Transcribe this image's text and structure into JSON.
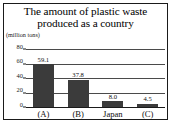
{
  "figure": {
    "title_line1": "The amount of plastic waste",
    "title_line2": "produced as a country",
    "unit_label": "(million tons)"
  },
  "chart_data": {
    "type": "bar",
    "title": "The amount of plastic waste produced as a country",
    "xlabel": "",
    "ylabel": "(million tons)",
    "ylim": [
      0,
      80
    ],
    "yticks": [
      "0",
      "20",
      "40",
      "60",
      "80"
    ],
    "grid": true,
    "legend": "none",
    "bar_color": "#3b3b3b",
    "categories": [
      "(A)",
      "(B)",
      "Japan",
      "(C)"
    ],
    "values": [
      59.1,
      37.8,
      8.0,
      4.5
    ],
    "value_labels": [
      "59.1",
      "37.8",
      "8.0",
      "4.5"
    ]
  }
}
